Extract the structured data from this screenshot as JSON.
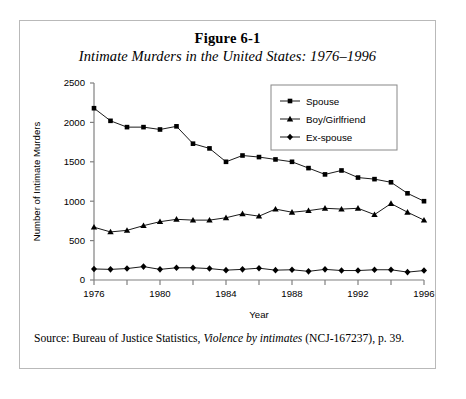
{
  "figure": {
    "number": "Figure 6-1",
    "subtitle": "Intimate Murders in the United States: 1976–1996",
    "source_prefix": "Source: Bureau of Justice Statistics, ",
    "source_italic": "Violence by intimates",
    "source_suffix": " (NCJ-167237), p. 39."
  },
  "chart_data": {
    "type": "line",
    "title": "Intimate Murders in the United States: 1976–1996",
    "xlabel": "Year",
    "ylabel": "Number of Intimate Murders",
    "xlim": [
      1976,
      1996
    ],
    "ylim": [
      0,
      2500
    ],
    "yticks": [
      0,
      500,
      1000,
      1500,
      2000,
      2500
    ],
    "xticks": [
      1976,
      1980,
      1984,
      1988,
      1992,
      1996
    ],
    "xtick_labels": [
      "1976",
      "1980",
      "1984",
      "1988",
      "1992",
      "1996"
    ],
    "ytick_labels": [
      "0",
      "500",
      "1000",
      "1500",
      "2000",
      "2500"
    ],
    "minor_xtick_step": 2,
    "grid": false,
    "legend_position": "top-right",
    "x": [
      1976,
      1977,
      1978,
      1979,
      1980,
      1981,
      1982,
      1983,
      1984,
      1985,
      1986,
      1987,
      1988,
      1989,
      1990,
      1991,
      1992,
      1993,
      1994,
      1995,
      1996
    ],
    "series": [
      {
        "name": "Spouse",
        "marker": "square",
        "values": [
          2180,
          2020,
          1940,
          1940,
          1910,
          1950,
          1730,
          1670,
          1500,
          1580,
          1560,
          1530,
          1500,
          1420,
          1340,
          1390,
          1300,
          1280,
          1240,
          1100,
          1000
        ]
      },
      {
        "name": "Boy/Girlfriend",
        "marker": "triangle",
        "values": [
          670,
          610,
          630,
          690,
          740,
          770,
          760,
          760,
          790,
          840,
          810,
          900,
          860,
          880,
          910,
          900,
          910,
          830,
          970,
          860,
          760
        ]
      },
      {
        "name": "Ex-spouse",
        "marker": "diamond",
        "values": [
          140,
          135,
          145,
          170,
          135,
          155,
          155,
          145,
          125,
          135,
          150,
          125,
          130,
          110,
          135,
          120,
          120,
          130,
          130,
          100,
          120
        ]
      }
    ]
  },
  "legend": {
    "items": [
      {
        "label": "Spouse"
      },
      {
        "label": "Boy/Girlfriend"
      },
      {
        "label": "Ex-spouse"
      }
    ]
  },
  "colors": {
    "line": "#000000",
    "axis": "#808080",
    "border": "#b9b9b9"
  }
}
